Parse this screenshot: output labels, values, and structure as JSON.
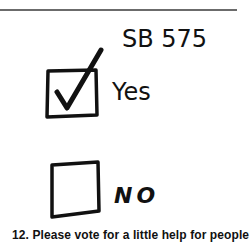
{
  "ballot": {
    "title": "SB 575",
    "options": [
      {
        "label": "Yes",
        "checked": true
      },
      {
        "label": "NO",
        "checked": false
      }
    ]
  },
  "caption": "12. Please vote for a little help for people",
  "colors": {
    "ink": "#111111",
    "rule": "#6b6b6b",
    "background": "#ffffff"
  }
}
